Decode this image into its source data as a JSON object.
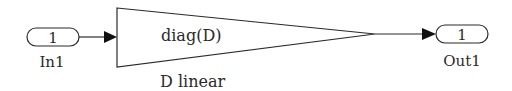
{
  "diagram": {
    "type": "simulink-block-diagram",
    "blocks": {
      "inport": {
        "number": "1",
        "label": "In1"
      },
      "gain": {
        "expression": "diag(D)",
        "label": "D linear"
      },
      "outport": {
        "number": "1",
        "label": "Out1"
      }
    },
    "connections": [
      {
        "from": "In1",
        "to": "D linear"
      },
      {
        "from": "D linear",
        "to": "Out1"
      }
    ],
    "colors": {
      "stroke": "#2a2a2a",
      "background": "#ffffff"
    }
  }
}
